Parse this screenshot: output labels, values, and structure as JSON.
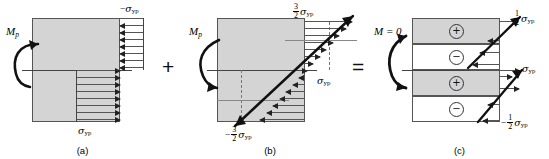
{
  "figure": {
    "type": "stress-distribution-decomposition",
    "operators": {
      "plus": "+",
      "equals": "="
    },
    "captions": {
      "a": "(a)",
      "b": "(b)",
      "c": "(c)"
    }
  },
  "panel_a": {
    "caption": "(a)",
    "moment_label": {
      "symbol": "M",
      "subscript": "p"
    },
    "top_stress_label": {
      "sign": "−",
      "symbol": "σ",
      "subscript": "yp"
    },
    "bottom_stress_label": {
      "sign": "",
      "symbol": "σ",
      "subscript": "yp"
    },
    "description": "Fully plastic rectangular stress block",
    "top_arrow_direction": "left",
    "bottom_arrow_direction": "right",
    "arrow_count_top": 7,
    "arrow_count_bottom": 7
  },
  "panel_b": {
    "caption": "(b)",
    "moment_label": {
      "symbol": "M",
      "subscript": "p"
    },
    "top_stress_label": {
      "sign": "",
      "numerator": "3",
      "denominator": "2",
      "symbol": "σ",
      "subscript": "yp"
    },
    "bottom_stress_label": {
      "sign": "−",
      "numerator": "3",
      "denominator": "2",
      "symbol": "σ",
      "subscript": "yp"
    },
    "mid_stress_label": {
      "symbol": "σ",
      "subscript": "yp"
    },
    "description": "Elastic unloading linear stress distribution",
    "top_arrow_direction": "right",
    "bottom_arrow_direction": "left"
  },
  "panel_c": {
    "caption": "(c)",
    "moment_label": {
      "text": "M = 0"
    },
    "top_stress_label": {
      "sign": "",
      "numerator": "1",
      "denominator": "2",
      "symbol": "σ",
      "subscript": "yp"
    },
    "bottom_stress_label": {
      "sign": "−",
      "numerator": "1",
      "denominator": "2",
      "symbol": "σ",
      "subscript": "yp"
    },
    "mid_stress_label": {
      "symbol": "σ",
      "subscript": "yp"
    },
    "description": "Residual stress distribution with zero net moment",
    "bands": [
      {
        "sign": "⊕",
        "shade": "gray"
      },
      {
        "sign": "⊖",
        "shade": "white"
      },
      {
        "sign": "⊕",
        "shade": "gray"
      },
      {
        "sign": "⊖",
        "shade": "white"
      }
    ]
  },
  "colors": {
    "section_fill": "#d4d4d4",
    "outline": "#555555",
    "arrow": "#222222",
    "background": "#ffffff"
  }
}
